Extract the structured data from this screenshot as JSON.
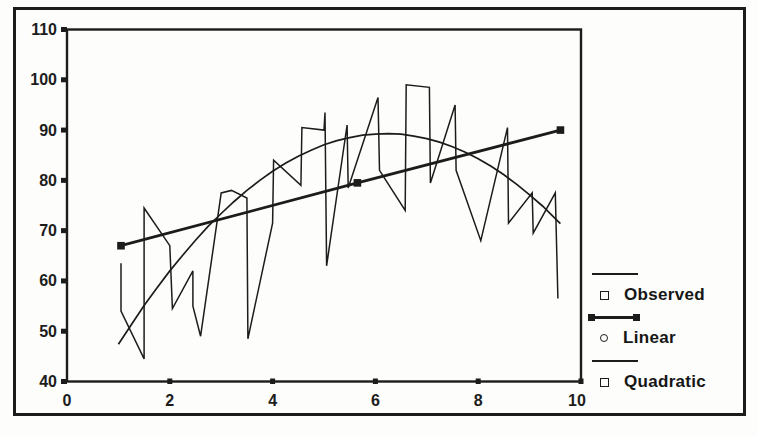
{
  "figure": {
    "colors": {
      "ink": "#1c1c1c",
      "paper": "#fdfdfb"
    }
  },
  "chart_data": {
    "type": "line",
    "title": "",
    "xlabel": "",
    "ylabel": "",
    "xlim": [
      0,
      10
    ],
    "ylim": [
      40,
      110
    ],
    "x_ticks": [
      0,
      2,
      4,
      6,
      8,
      10
    ],
    "y_ticks": [
      40,
      50,
      60,
      70,
      80,
      90,
      100,
      110
    ],
    "grid": false,
    "legend_position": "right-outside",
    "series": [
      {
        "name": "Observed",
        "line": "thin",
        "marker": "none",
        "points": [
          [
            1.05,
            63.5
          ],
          [
            1.05,
            54
          ],
          [
            1.5,
            44.5
          ],
          [
            1.5,
            74.5
          ],
          [
            2.0,
            67
          ],
          [
            2.05,
            54.5
          ],
          [
            2.45,
            62
          ],
          [
            2.45,
            55
          ],
          [
            2.6,
            49
          ],
          [
            3.0,
            77.5
          ],
          [
            3.2,
            78
          ],
          [
            3.5,
            76.5
          ],
          [
            3.52,
            48.5
          ],
          [
            4.0,
            71.5
          ],
          [
            4.02,
            84
          ],
          [
            4.55,
            79
          ],
          [
            4.57,
            90.5
          ],
          [
            5.0,
            90
          ],
          [
            5.02,
            93.5
          ],
          [
            5.05,
            63
          ],
          [
            5.45,
            91
          ],
          [
            5.47,
            78.5
          ],
          [
            6.05,
            96.5
          ],
          [
            6.08,
            82
          ],
          [
            6.58,
            74
          ],
          [
            6.6,
            99
          ],
          [
            7.05,
            98.5
          ],
          [
            7.07,
            79.5
          ],
          [
            7.55,
            95
          ],
          [
            7.57,
            82
          ],
          [
            8.05,
            68
          ],
          [
            8.57,
            90.5
          ],
          [
            8.59,
            71.5
          ],
          [
            9.05,
            77.5
          ],
          [
            9.07,
            69.5
          ],
          [
            9.5,
            77.5
          ],
          [
            9.55,
            56.5
          ]
        ]
      },
      {
        "name": "Linear",
        "line": "thick",
        "marker": "filled-square",
        "points": [
          [
            1.05,
            67
          ],
          [
            5.65,
            79.5
          ],
          [
            9.6,
            90
          ]
        ]
      },
      {
        "name": "Quadratic",
        "line": "thin-smooth",
        "marker": "none",
        "points": [
          [
            1.0,
            47.4
          ],
          [
            1.25,
            51.3
          ],
          [
            1.5,
            55.1
          ],
          [
            1.75,
            58.6
          ],
          [
            2.0,
            62.0
          ],
          [
            2.25,
            65.1
          ],
          [
            2.5,
            68.1
          ],
          [
            2.75,
            70.9
          ],
          [
            3.0,
            73.4
          ],
          [
            3.25,
            75.8
          ],
          [
            3.5,
            78.0
          ],
          [
            3.75,
            80.0
          ],
          [
            4.0,
            81.8
          ],
          [
            4.25,
            83.4
          ],
          [
            4.5,
            84.8
          ],
          [
            4.75,
            86.0
          ],
          [
            5.0,
            87.1
          ],
          [
            5.25,
            87.9
          ],
          [
            5.5,
            88.5
          ],
          [
            5.75,
            89.0
          ],
          [
            6.0,
            89.2
          ],
          [
            6.25,
            89.3
          ],
          [
            6.5,
            89.2
          ],
          [
            6.75,
            88.8
          ],
          [
            7.0,
            88.3
          ],
          [
            7.25,
            87.6
          ],
          [
            7.5,
            86.7
          ],
          [
            7.75,
            85.6
          ],
          [
            8.0,
            84.3
          ],
          [
            8.25,
            82.8
          ],
          [
            8.5,
            81.1
          ],
          [
            8.75,
            79.2
          ],
          [
            9.0,
            77.1
          ],
          [
            9.25,
            74.9
          ],
          [
            9.5,
            72.4
          ],
          [
            9.6,
            71.4
          ]
        ]
      }
    ],
    "legend": [
      {
        "label": "Observed",
        "swatch": "thin-line",
        "marker": "open-square"
      },
      {
        "label": "Linear",
        "swatch": "thick-line-with-square-ends",
        "marker": "open-circle"
      },
      {
        "label": "Quadratic",
        "swatch": "thin-line",
        "marker": "open-square"
      }
    ]
  }
}
